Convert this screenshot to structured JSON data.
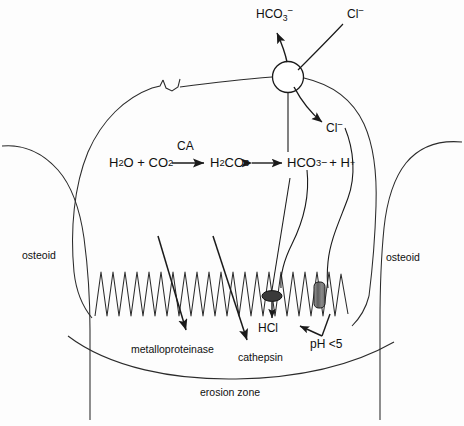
{
  "figure": {
    "background_color": "#fdfdfd",
    "ink_color": "#1a1a1a"
  },
  "labels": {
    "bicarbonate_out": "HCO3−",
    "chloride_in": "Cl−",
    "chloride_cyto": "Cl−",
    "osteoid_left": "osteoid",
    "osteoid_right": "osteoid",
    "erosion_zone": "erosion zone",
    "metalloproteinase": "metalloproteinase",
    "cathepsin": "cathepsin",
    "hcl": "HCl",
    "ph": "pH <5"
  },
  "equation": {
    "reactants": "H2O + CO2",
    "enzyme": "CA",
    "intermediate": "H2CO3",
    "products_anion": "HCO3−",
    "products_proton": "+ H +",
    "forward_arrow": "→",
    "equilibrium_arrow": "↔",
    "parts": {
      "h2o": "H",
      "h2o_sub": "2",
      "h2o_rest": "O + CO",
      "co2_sub": "2",
      "h2co3_h": "H",
      "h2co3_sub1": "2",
      "h2co3_c": "CO",
      "h2co3_sub2": "3",
      "hco3_h": "HCO",
      "hco3_sub": "3",
      "hco3_charge": "−",
      "plus_h": "+ H",
      "h_charge": "+"
    }
  },
  "ions": {
    "hco3_base": "HCO",
    "hco3_sub": "3",
    "hco3_charge": "−",
    "cl_base": "Cl",
    "cl_charge": "−"
  },
  "structures": {
    "exchanger_name": "anion-exchanger",
    "chloride_channel_name": "chloride-channel",
    "proton_pump_name": "proton-pump",
    "ruffled_border_name": "ruffled-border",
    "sealing_zone_name": "sealing-zone"
  }
}
